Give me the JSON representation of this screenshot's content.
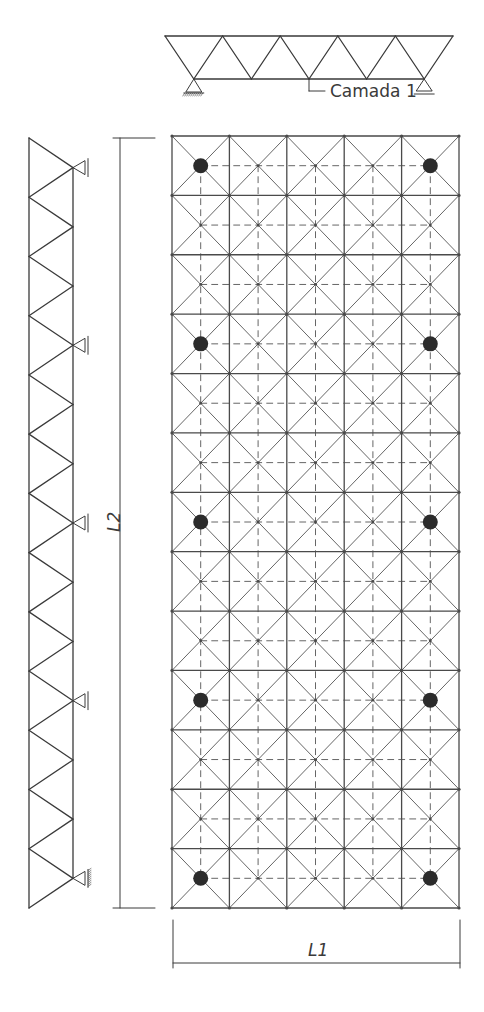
{
  "diagram": {
    "type": "space-truss-plan",
    "colors": {
      "line": "#3a3a3a",
      "grid": "#4a4a4a",
      "diagonal": "#555555",
      "dashed": "#555555",
      "support_dot": "#2b2b2b",
      "background": "#ffffff"
    },
    "top_truss": {
      "label": "Camada 1",
      "panels": 5,
      "supports": [
        "pinned",
        "roller"
      ]
    },
    "side_truss": {
      "panels": 13,
      "supports_count": 5
    },
    "plan_grid": {
      "columns": 5,
      "rows": 13,
      "support_columns": [
        0,
        4
      ],
      "support_rows": [
        0,
        3,
        6,
        9,
        12
      ]
    },
    "dimensions": {
      "horizontal_label": "L1",
      "vertical_label": "L2"
    }
  }
}
